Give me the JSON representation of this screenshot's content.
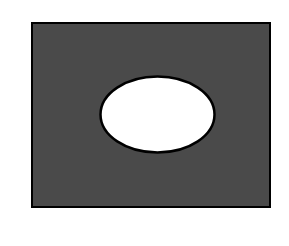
{
  "diagram": {
    "type": "venn-complement",
    "colors": {
      "background": "#ffffff",
      "universe_fill": "#4a4a4a",
      "set_fill": "#ffffff",
      "stroke": "#000000"
    },
    "universe": {
      "x": 32,
      "y": 23,
      "width": 238,
      "height": 184
    },
    "set": {
      "cx": 157.5,
      "cy": 114.5,
      "rx": 57,
      "ry": 38
    }
  }
}
